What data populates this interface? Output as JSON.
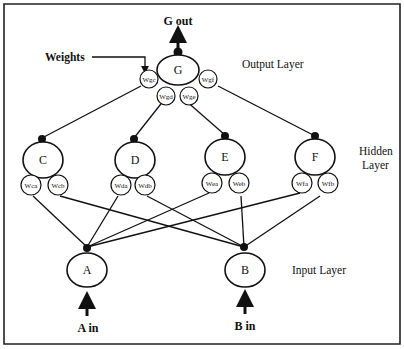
{
  "diagram": {
    "title_output": "G out",
    "weights_callout": "Weights",
    "layers": {
      "output": "Output Layer",
      "hidden_line1": "Hidden",
      "hidden_line2": "Layer",
      "input": "Input Layer"
    },
    "nodes": {
      "G": "G",
      "C": "C",
      "D": "D",
      "E": "E",
      "F": "F",
      "A": "A",
      "B": "B"
    },
    "weights": {
      "wgc": "Wgc",
      "wgd": "Wgd",
      "wge": "Wge",
      "wgf": "Wgf",
      "wca": "Wca",
      "wcb": "Wcb",
      "wda": "Wda",
      "wdb": "Wdb",
      "wea": "Wea",
      "web": "Web",
      "wfa": "Wfa",
      "wfb": "Wfb"
    },
    "inputs": {
      "a_in": "A in",
      "b_in": "B in"
    }
  }
}
